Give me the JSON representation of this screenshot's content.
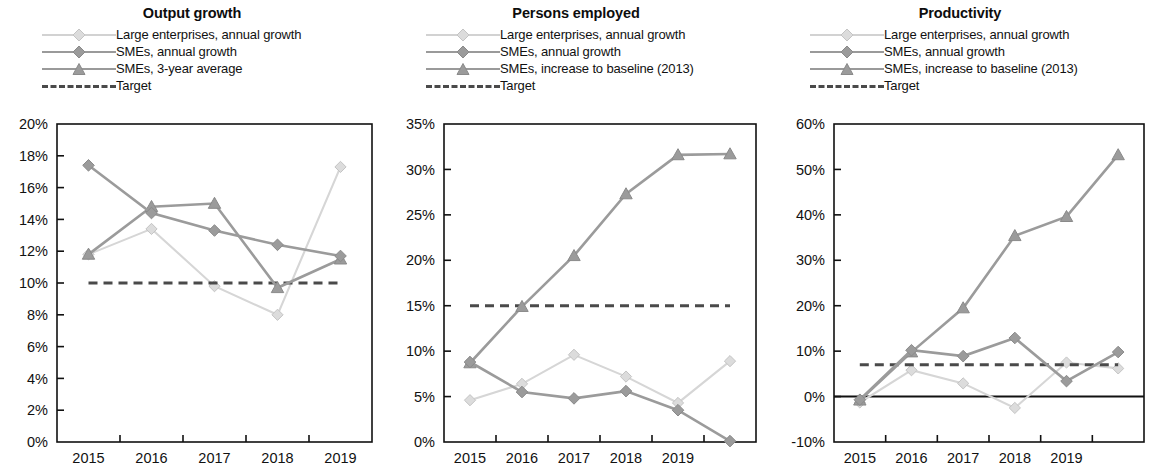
{
  "figure": {
    "panel_count": 3
  },
  "panels": [
    {
      "title": "Output growth",
      "legend": [
        {
          "label": "Large enterprises, annual growth",
          "style": "light-diamond"
        },
        {
          "label": "SMEs, annual growth",
          "style": "mid-diamond"
        },
        {
          "label": "SMEs, 3-year average",
          "style": "mid-triangle"
        },
        {
          "label": "Target",
          "style": "dashed"
        }
      ],
      "chart_data": {
        "type": "line",
        "title": "Output growth",
        "xlabel": "",
        "ylabel": "",
        "x": [
          "2015",
          "2016",
          "2017",
          "2018",
          "2019"
        ],
        "tick_labels": [
          "2015",
          "2016",
          "2017",
          "2018",
          "2019"
        ],
        "ylim": [
          0,
          20
        ],
        "yticks": [
          0,
          2,
          4,
          6,
          8,
          10,
          12,
          14,
          16,
          18,
          20
        ],
        "ytick_labels": [
          "0%",
          "2%",
          "4%",
          "6%",
          "8%",
          "10%",
          "12%",
          "14%",
          "16%",
          "18%",
          "20%"
        ],
        "grid": false,
        "legend_position": "top",
        "unit": "%",
        "series": [
          {
            "name": "Large enterprises, annual growth",
            "marker": "diamond",
            "color": "#dcdcdc",
            "values": [
              11.8,
              13.4,
              9.8,
              8.0,
              17.3
            ]
          },
          {
            "name": "SMEs, annual growth",
            "marker": "diamond",
            "color": "#9b9b9b",
            "values": [
              17.4,
              14.4,
              13.3,
              12.4,
              11.7
            ]
          },
          {
            "name": "SMEs, 3-year average",
            "marker": "triangle",
            "color": "#9b9b9b",
            "values": [
              11.8,
              14.8,
              15.0,
              9.7,
              11.5
            ]
          },
          {
            "name": "Target",
            "marker": "none",
            "color": "#4a4a4a",
            "values": [
              10,
              10,
              10,
              10,
              10
            ],
            "dashed": true
          }
        ]
      }
    },
    {
      "title": "Persons employed",
      "legend": [
        {
          "label": "Large enterprises, annual growth",
          "style": "light-diamond"
        },
        {
          "label": "SMEs, annual growth",
          "style": "mid-diamond"
        },
        {
          "label": "SMEs, increase to baseline (2013)",
          "style": "mid-triangle"
        },
        {
          "label": "Target",
          "style": "dashed"
        }
      ],
      "chart_data": {
        "type": "line",
        "title": "Persons employed",
        "xlabel": "",
        "ylabel": "",
        "x": [
          "2015",
          "2016",
          "2017",
          "2018",
          "2019",
          ""
        ],
        "tick_labels": [
          "2015",
          "2016",
          "2017",
          "2018",
          "2019",
          ""
        ],
        "ylim": [
          0,
          35
        ],
        "yticks": [
          0,
          5,
          10,
          15,
          20,
          25,
          30,
          35
        ],
        "ytick_labels": [
          "0%",
          "5%",
          "10%",
          "15%",
          "20%",
          "25%",
          "30%",
          "35%"
        ],
        "grid": false,
        "legend_position": "top",
        "unit": "%",
        "series": [
          {
            "name": "Large enterprises, annual growth",
            "marker": "diamond",
            "color": "#dcdcdc",
            "values": [
              4.6,
              6.4,
              9.6,
              7.2,
              4.3,
              8.9
            ]
          },
          {
            "name": "SMEs, annual growth",
            "marker": "diamond",
            "color": "#9b9b9b",
            "values": [
              8.8,
              5.5,
              4.8,
              5.6,
              3.5,
              0.1
            ]
          },
          {
            "name": "SMEs, increase to baseline (2013)",
            "marker": "triangle",
            "color": "#9b9b9b",
            "values": [
              8.7,
              14.9,
              20.5,
              27.3,
              31.6,
              31.7
            ]
          },
          {
            "name": "Target",
            "marker": "none",
            "color": "#4a4a4a",
            "values": [
              15,
              15,
              15,
              15,
              15,
              15
            ],
            "dashed": true
          }
        ]
      }
    },
    {
      "title": "Productivity",
      "legend": [
        {
          "label": "Large enterprises, annual growth",
          "style": "light-diamond"
        },
        {
          "label": "SMEs, annual growth",
          "style": "mid-diamond"
        },
        {
          "label": "SMEs, increase to baseline (2013)",
          "style": "mid-triangle"
        },
        {
          "label": "Target",
          "style": "dashed"
        }
      ],
      "chart_data": {
        "type": "line",
        "title": "Productivity",
        "xlabel": "",
        "ylabel": "",
        "x": [
          "2015",
          "2016",
          "2017",
          "2018",
          "2019",
          ""
        ],
        "tick_labels": [
          "2015",
          "2016",
          "2017",
          "2018",
          "2019",
          ""
        ],
        "ylim": [
          -10,
          60
        ],
        "yticks": [
          -10,
          0,
          10,
          20,
          30,
          40,
          50,
          60
        ],
        "ytick_labels": [
          "-10%",
          "0%",
          "10%",
          "20%",
          "30%",
          "40%",
          "50%",
          "60%"
        ],
        "grid": false,
        "legend_position": "top",
        "unit": "%",
        "series": [
          {
            "name": "Large enterprises, annual growth",
            "marker": "diamond",
            "color": "#dcdcdc",
            "values": [
              -1.3,
              5.8,
              2.9,
              -2.5,
              7.5,
              6.2
            ]
          },
          {
            "name": "SMEs, annual growth",
            "marker": "diamond",
            "color": "#9b9b9b",
            "values": [
              -0.7,
              10.2,
              8.9,
              12.9,
              3.4,
              9.8
            ]
          },
          {
            "name": "SMEs, increase to baseline (2013)",
            "marker": "triangle",
            "color": "#9b9b9b",
            "values": [
              -0.8,
              9.8,
              19.5,
              35.4,
              39.6,
              53.2
            ]
          },
          {
            "name": "Target",
            "marker": "none",
            "color": "#4a4a4a",
            "values": [
              7,
              7,
              7,
              7,
              7,
              7
            ],
            "dashed": true
          }
        ]
      }
    }
  ]
}
